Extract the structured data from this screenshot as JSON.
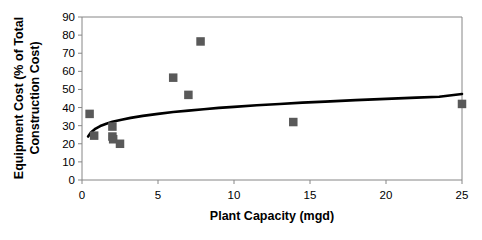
{
  "chart_data": {
    "type": "scatter",
    "title": "",
    "xlabel": "Plant Capacity (mgd)",
    "ylabel": "Equipment Cost (% of Total Construction Cost)",
    "ylabel_line1": "Equipment Cost (% of Total",
    "ylabel_line2": "Construction Cost)",
    "xlim": [
      0,
      25
    ],
    "ylim": [
      0,
      90
    ],
    "xticks": [
      0,
      5,
      10,
      15,
      20,
      25
    ],
    "yticks": [
      0,
      10,
      20,
      30,
      40,
      50,
      60,
      70,
      80,
      90
    ],
    "xtick_labels": [
      "0",
      "5",
      "10",
      "15",
      "20",
      "25"
    ],
    "ytick_labels": [
      "0",
      "10",
      "20",
      "30",
      "40",
      "50",
      "60",
      "70",
      "80",
      "90"
    ],
    "grid": false,
    "legend": false,
    "legend_position": "none",
    "marker_color": "#595959",
    "marker_shape": "square",
    "trendline_color": "#000000",
    "axis_color": "#868686",
    "series": [
      {
        "name": "Equipment Cost Data",
        "type": "scatter",
        "points": [
          {
            "x": 0.5,
            "y": 36.5
          },
          {
            "x": 0.8,
            "y": 24.5
          },
          {
            "x": 2.0,
            "y": 29.5
          },
          {
            "x": 2.0,
            "y": 24.0
          },
          {
            "x": 2.05,
            "y": 22.5
          },
          {
            "x": 2.5,
            "y": 20.0
          },
          {
            "x": 6.0,
            "y": 56.5
          },
          {
            "x": 7.0,
            "y": 47.0
          },
          {
            "x": 7.8,
            "y": 76.5
          },
          {
            "x": 13.9,
            "y": 32.0
          },
          {
            "x": 25.0,
            "y": 42.0
          }
        ]
      },
      {
        "name": "Trend Line",
        "type": "line",
        "points": [
          {
            "x": 0.4,
            "y": 24.0
          },
          {
            "x": 0.6,
            "y": 26.3
          },
          {
            "x": 0.9,
            "y": 28.4
          },
          {
            "x": 1.2,
            "y": 29.8
          },
          {
            "x": 1.6,
            "y": 31.1
          },
          {
            "x": 2.0,
            "y": 32.1
          },
          {
            "x": 2.6,
            "y": 33.3
          },
          {
            "x": 3.2,
            "y": 34.3
          },
          {
            "x": 4.0,
            "y": 35.4
          },
          {
            "x": 5.0,
            "y": 36.5
          },
          {
            "x": 6.0,
            "y": 37.5
          },
          {
            "x": 7.0,
            "y": 38.3
          },
          {
            "x": 8.0,
            "y": 39.1
          },
          {
            "x": 9.0,
            "y": 39.8
          },
          {
            "x": 10.0,
            "y": 40.4
          },
          {
            "x": 11.5,
            "y": 41.3
          },
          {
            "x": 13.0,
            "y": 42.0
          },
          {
            "x": 14.5,
            "y": 42.7
          },
          {
            "x": 16.0,
            "y": 43.3
          },
          {
            "x": 18.0,
            "y": 44.1
          },
          {
            "x": 20.0,
            "y": 44.8
          },
          {
            "x": 22.0,
            "y": 45.5
          },
          {
            "x": 23.5,
            "y": 46.0
          },
          {
            "x": 25.0,
            "y": 47.5
          }
        ]
      }
    ]
  }
}
